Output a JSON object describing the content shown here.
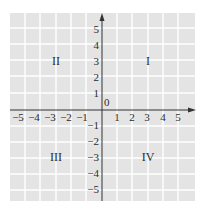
{
  "diagram": {
    "origin_label": "0",
    "x_ticks": [
      "-5",
      "-4",
      "-3",
      "-2",
      "-1",
      "1",
      "2",
      "3",
      "4",
      "5"
    ],
    "y_ticks": [
      "5",
      "4",
      "3",
      "2",
      "1",
      "-1",
      "-2",
      "-3",
      "-4",
      "-5"
    ],
    "quadrants": {
      "q1": "I",
      "q2": "II",
      "q3": "III",
      "q4": "IV"
    },
    "colors": {
      "grid_background": "#e4e4e4",
      "grid_lines": "#ffffff",
      "axis": "#333333",
      "text": "#2a2a2a"
    }
  }
}
